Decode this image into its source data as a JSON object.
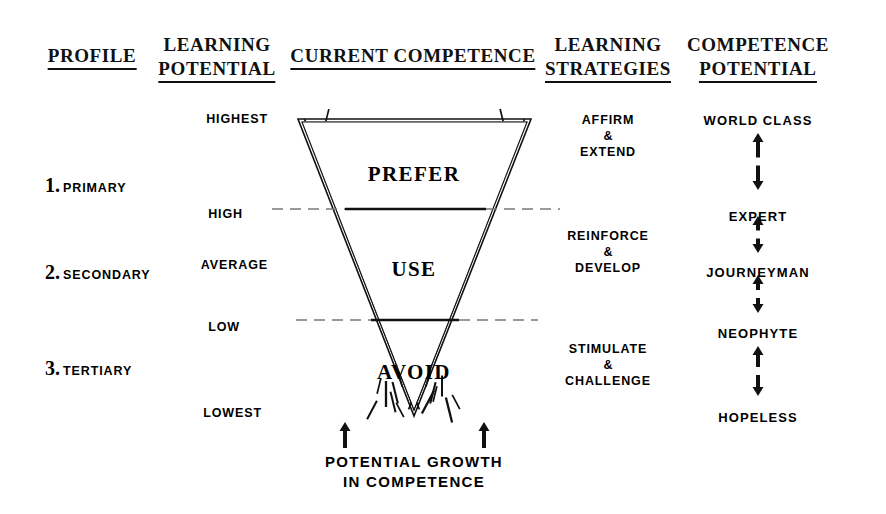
{
  "headers": [
    {
      "id": "profile",
      "lines": [
        "PROFILE"
      ],
      "x": 92,
      "y": 44
    },
    {
      "id": "learning-potential",
      "lines": [
        "LEARNING",
        "POTENTIAL"
      ],
      "x": 217,
      "y": 33
    },
    {
      "id": "current-competence",
      "lines": [
        "CURRENT COMPETENCE"
      ],
      "x": 413,
      "y": 44
    },
    {
      "id": "learning-strategies",
      "lines": [
        "LEARNING",
        "STRATEGIES"
      ],
      "x": 608,
      "y": 33
    },
    {
      "id": "competence-potential",
      "lines": [
        "COMPETENCE",
        "POTENTIAL"
      ],
      "x": 758,
      "y": 33
    }
  ],
  "profiles": [
    {
      "num": "1.",
      "label": "PRIMARY",
      "x": 45,
      "y": 175
    },
    {
      "num": "2.",
      "label": "SECONDARY",
      "x": 45,
      "y": 262
    },
    {
      "num": "3.",
      "label": "TERTIARY",
      "x": 45,
      "y": 358
    }
  ],
  "scale_levels": [
    {
      "label": "HIGHEST",
      "x": 268,
      "y": 112
    },
    {
      "label": "HIGH",
      "x": 243,
      "y": 207
    },
    {
      "label": "AVERAGE",
      "x": 268,
      "y": 258
    },
    {
      "label": "LOW",
      "x": 240,
      "y": 320
    },
    {
      "label": "LOWEST",
      "x": 262,
      "y": 406
    }
  ],
  "competence_zones": [
    {
      "label": "PREFER",
      "x": 414,
      "y": 162
    },
    {
      "label": "USE",
      "x": 414,
      "y": 257
    },
    {
      "label": "AVOID",
      "x": 414,
      "y": 360
    }
  ],
  "strategies": [
    {
      "id": "affirm-extend",
      "line1": "AFFIRM",
      "amp": "&",
      "line2": "EXTEND",
      "x": 608,
      "y": 112
    },
    {
      "id": "reinforce-develop",
      "line1": "REINFORCE",
      "amp": "&",
      "line2": "DEVELOP",
      "x": 608,
      "y": 228
    },
    {
      "id": "stimulate-challenge",
      "line1": "STIMULATE",
      "amp": "&",
      "line2": "CHALLENGE",
      "x": 608,
      "y": 341
    }
  ],
  "competence_ranks": [
    {
      "label": "WORLD CLASS",
      "x": 758,
      "y": 113
    },
    {
      "label": "EXPERT",
      "x": 758,
      "y": 209
    },
    {
      "label": "JOURNEYMAN",
      "x": 758,
      "y": 265
    },
    {
      "label": "NEOPHYTE",
      "x": 758,
      "y": 326
    },
    {
      "label": "HOPELESS",
      "x": 758,
      "y": 410
    }
  ],
  "rank_arrows": [
    {
      "x": 758,
      "top": 133,
      "bottom": 190
    },
    {
      "x": 758,
      "top": 216,
      "bottom": 253
    },
    {
      "x": 758,
      "top": 275,
      "bottom": 313
    },
    {
      "x": 758,
      "top": 346,
      "bottom": 396
    }
  ],
  "growth_arrows": [
    {
      "x": 345,
      "top": 422,
      "bottom": 448
    },
    {
      "x": 484,
      "top": 422,
      "bottom": 448
    }
  ],
  "caption": {
    "line1": "POTENTIAL GROWTH",
    "line2": "IN COMPETENCE",
    "x": 414,
    "y": 452
  },
  "triangle": {
    "apex_x": 414,
    "apex_y": 416,
    "top_y": 119,
    "top_left_x": 298,
    "top_right_x": 531
  },
  "dividers": [
    {
      "id": "high-divider",
      "y": 209,
      "solid_x1": 345,
      "solid_x2": 486,
      "dash_x1": 272,
      "dash_x2": 560
    },
    {
      "id": "low-divider",
      "y": 320,
      "solid_x1": 371,
      "solid_x2": 459,
      "dash_x1": 296,
      "dash_x2": 538
    }
  ],
  "colors": {
    "ink": "#111111",
    "background": "#ffffff",
    "dash": "#7a7a7a"
  }
}
